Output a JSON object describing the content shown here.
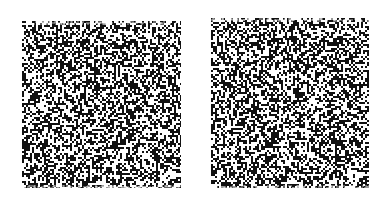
{
  "figure": {
    "type": "random-dot stereogram pair",
    "background": "#ffffff",
    "dot_color": "#111111",
    "dot_density": 0.5,
    "panels": [
      {
        "id": "left",
        "x": 22,
        "y": 21,
        "width": 159,
        "height": 167,
        "seed": 12345
      },
      {
        "id": "right",
        "x": 211,
        "y": 18,
        "width": 158,
        "height": 170,
        "seed": 12345
      }
    ]
  }
}
